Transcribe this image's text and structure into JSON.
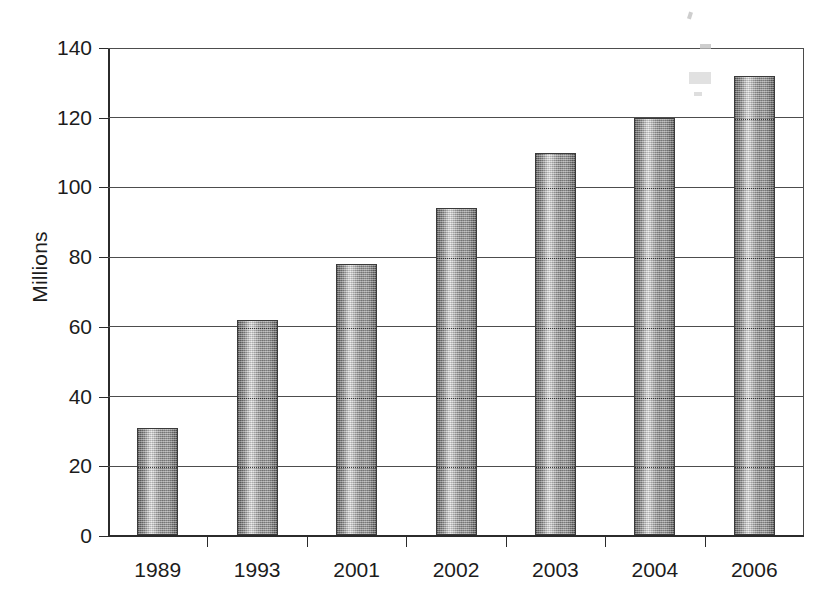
{
  "chart_data": {
    "type": "bar",
    "title": "",
    "subtitle": "",
    "xlabel": "",
    "ylabel": "Millions",
    "categories": [
      "1989",
      "1993",
      "2001",
      "2002",
      "2003",
      "2004",
      "2006"
    ],
    "values": [
      31,
      62,
      78,
      94,
      110,
      120,
      132
    ],
    "series": [
      {
        "name": "Millions",
        "values": [
          31,
          62,
          78,
          94,
          110,
          120,
          132
        ]
      }
    ],
    "ylim": [
      0,
      140
    ],
    "yticks": [
      0,
      20,
      40,
      60,
      80,
      100,
      120,
      140
    ],
    "ytick_labels": [
      "0",
      "20",
      "40",
      "60",
      "80",
      "100",
      "120",
      "140"
    ],
    "grid": true,
    "grid_axis": "y",
    "legend": false,
    "legend_position": "none",
    "annotations": [],
    "colors": {
      "bar_fill_light": "#e6e6e6",
      "bar_fill_dark": "#5d5d5d",
      "bar_outline": "#3a3a3a",
      "gridline": "#4d4d4d",
      "axis": "#2b2b2b",
      "text": "#1c1c1c",
      "background": "#ffffff"
    }
  }
}
